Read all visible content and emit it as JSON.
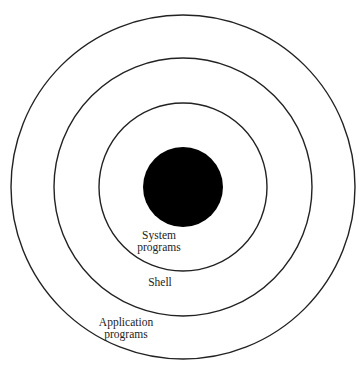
{
  "diagram": {
    "type": "concentric-layers",
    "center": {
      "x": 183,
      "y": 187
    },
    "colors": {
      "stroke": "#222222",
      "core": "#000000",
      "background": "#ffffff"
    },
    "core": {
      "name": "kernel-core",
      "radius": 40
    },
    "rings": [
      {
        "name": "system-programs-ring",
        "radius": 84
      },
      {
        "name": "shell-ring",
        "radius": 129
      },
      {
        "name": "application-programs-ring",
        "radius": 172
      }
    ],
    "labels": {
      "system_programs": {
        "line1": "System",
        "line2": "programs"
      },
      "shell": {
        "line1": "Shell"
      },
      "application_programs": {
        "line1": "Application",
        "line2": "programs"
      }
    }
  }
}
